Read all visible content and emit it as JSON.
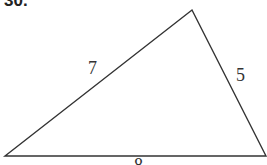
{
  "problem_number": "30.",
  "triangle": {
    "vertices": {
      "left": [
        5,
        156
      ],
      "apex": [
        192,
        10
      ],
      "right": [
        266,
        156
      ]
    },
    "sides": [
      {
        "name": "left",
        "label": "7"
      },
      {
        "name": "right",
        "label": "5"
      },
      {
        "name": "base",
        "label": "8"
      }
    ],
    "stroke_color": "#333333"
  }
}
